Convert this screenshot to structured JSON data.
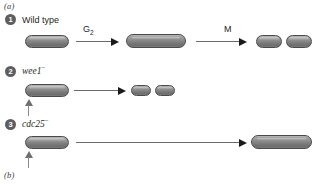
{
  "figure": {
    "panel_a_label": "(a)",
    "panel_b_label": "(b)"
  },
  "rows": [
    {
      "number": "1",
      "genotype": "Wild type",
      "genotype_superscript": "",
      "italic": false,
      "arrows": [
        {
          "caption": "G",
          "caption_sub": "2"
        },
        {
          "caption": "M",
          "caption_sub": ""
        }
      ],
      "stages": [
        {
          "name": "mother-cell",
          "count": 1
        },
        {
          "name": "grown-cell",
          "count": 1
        },
        {
          "name": "daughter-cells",
          "count": 2
        }
      ]
    },
    {
      "number": "2",
      "genotype": "wee1",
      "genotype_superscript": "−",
      "italic": true,
      "arrows": [
        {
          "caption": "",
          "caption_sub": ""
        }
      ],
      "stages": [
        {
          "name": "mother-cell",
          "count": 1
        },
        {
          "name": "daughter-cells",
          "count": 2
        }
      ]
    },
    {
      "number": "3",
      "genotype": "cdc25",
      "genotype_superscript": "−",
      "italic": true,
      "arrows": [
        {
          "caption": "",
          "caption_sub": ""
        }
      ],
      "stages": [
        {
          "name": "mother-cell",
          "count": 1
        },
        {
          "name": "elongated-cell",
          "count": 1
        }
      ]
    }
  ],
  "colors": {
    "cell_outline": "#4a4a4a",
    "cell_fill_light": "#b9b9b9",
    "cell_fill_dark": "#6e6e6e",
    "badge_fill": "#5e5e5e",
    "arrow_shaft": "#6b6b6b",
    "arrow_head": "#1a1a1a",
    "text": "#231f20"
  }
}
